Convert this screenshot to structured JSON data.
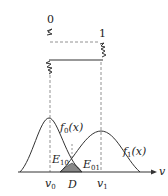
{
  "diagram": {
    "signal_levels": {
      "level0_label": "0",
      "level1_label": "1"
    },
    "curves": [
      {
        "name": "f0",
        "label_main": "f",
        "label_sub": "0",
        "label_arg": "(x)"
      },
      {
        "name": "f1",
        "label_main": "f",
        "label_sub": "1",
        "label_arg": "(x)"
      }
    ],
    "axis": {
      "label": "v",
      "ticks": [
        {
          "main": "v",
          "sub": "0"
        },
        {
          "main": "D",
          "sub": ""
        },
        {
          "main": "v",
          "sub": "1"
        }
      ]
    },
    "error_regions": [
      {
        "main": "E",
        "sub": "10"
      },
      {
        "main": "E",
        "sub": "01"
      }
    ],
    "colors": {
      "line": "#333333",
      "shade": "#888888",
      "dash": "#777777"
    }
  }
}
